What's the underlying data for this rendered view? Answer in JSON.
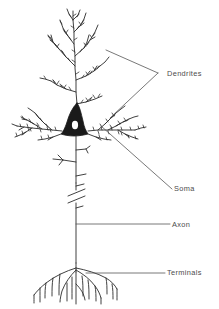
{
  "figure": {
    "style": "hand-drawn line art",
    "background_color": "#ffffff",
    "ink_color": "#2b2b2b",
    "label_color": "#4c4c4c",
    "leader_color": "#555555",
    "width": 219,
    "height": 309
  },
  "labels": {
    "dendrites": "Dendrites",
    "soma": "Soma",
    "axon": "Axon",
    "terminals": "Terminals"
  },
  "parts": [
    {
      "id": "dendrites",
      "label": "Dendrites",
      "description": "Branching spiny processes: apical tuft above the soma and basal arbors extending left and right",
      "leader_type": "double-line-arrow",
      "leader_converge": [
        158,
        73
      ],
      "leader_targets": [
        [
          106,
          50
        ],
        [
          110,
          118
        ]
      ]
    },
    {
      "id": "soma",
      "label": "Soma",
      "description": "Dark filled pyramidal cell body with a white nucleus",
      "leader_type": "diagonal-line",
      "leader_converge": [
        172,
        189
      ],
      "leader_targets": [
        [
          101,
          126
        ]
      ]
    },
    {
      "id": "axon",
      "label": "Axon",
      "description": "Long single process descending from the soma with collateral branches and an interruption break mark",
      "leader_type": "horizontal-line",
      "leader_converge": [
        170,
        224
      ],
      "leader_targets": [
        [
          76,
          224
        ]
      ]
    },
    {
      "id": "terminals",
      "label": "Terminals",
      "description": "Axon terminal arborization fanning out at the bottom",
      "leader_type": "horizontal-line",
      "leader_converge": [
        165,
        273
      ],
      "leader_targets": [
        [
          86,
          273
        ]
      ]
    }
  ]
}
